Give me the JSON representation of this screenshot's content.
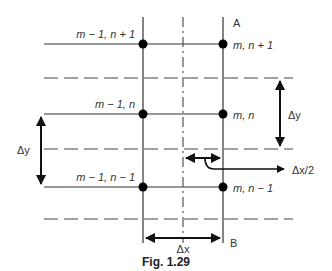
{
  "figure": {
    "caption": "Fig. 1.29",
    "boundary_labels": {
      "top": "A",
      "bottom": "B"
    },
    "nodes": [
      {
        "id": "m-1,n+1",
        "label": "m − 1, n + 1",
        "side": "left"
      },
      {
        "id": "m,n+1",
        "label": "m, n + 1",
        "side": "right"
      },
      {
        "id": "m-1,n",
        "label": "m − 1, n",
        "side": "left"
      },
      {
        "id": "m,n",
        "label": "m, n",
        "side": "right"
      },
      {
        "id": "m-1,n-1",
        "label": "m − 1, n − 1",
        "side": "left"
      },
      {
        "id": "m,n-1",
        "label": "m, n − 1",
        "side": "right"
      }
    ],
    "dimensions": {
      "dy_left": "Δy",
      "dy_right": "Δy",
      "dx": "Δx",
      "dx_half": "Δx/2"
    }
  }
}
